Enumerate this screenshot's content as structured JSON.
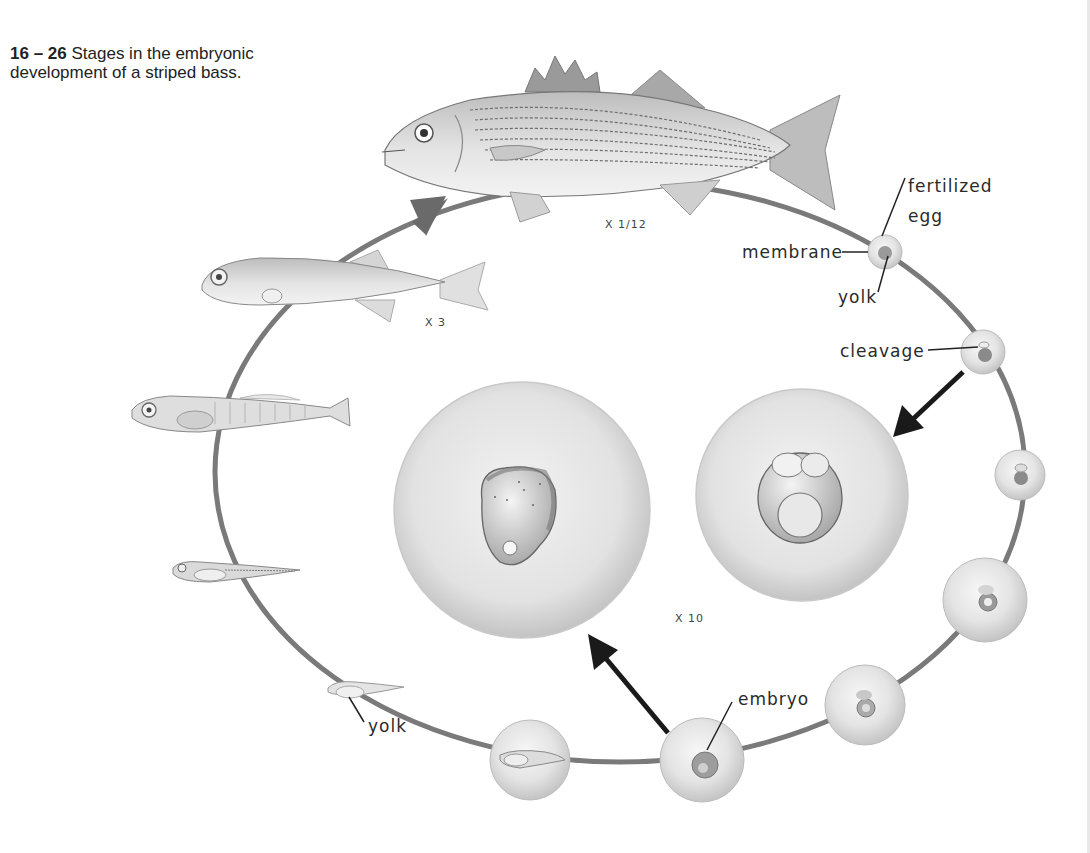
{
  "caption": {
    "figure_number": "16 – 26",
    "text": " Stages in the embryonic development of a striped bass."
  },
  "labels": {
    "fertilized_egg_line1": "fertilized",
    "fertilized_egg_line2": "egg",
    "membrane": "membrane",
    "yolk_egg": "yolk",
    "cleavage": "cleavage",
    "embryo": "embryo",
    "yolk_larva": "yolk"
  },
  "scales": {
    "adult": "X 1/12",
    "juvenile": "X 3",
    "eggs_enlarged": "X 10"
  },
  "colors": {
    "cycle_ring": "#7a7a7a",
    "arrow_dark": "#1a1a1a",
    "arrow_gray": "#6a6a6a",
    "egg_fill": "#e6e6e6",
    "fish_body": "#d9d9d9"
  },
  "stages": [
    {
      "name": "fertilized egg"
    },
    {
      "name": "cleavage"
    },
    {
      "name": "early blastula"
    },
    {
      "name": "gastrula"
    },
    {
      "name": "embryo forming"
    },
    {
      "name": "embryo"
    },
    {
      "name": "hatching larva"
    },
    {
      "name": "yolk-sac larva"
    },
    {
      "name": "larva"
    },
    {
      "name": "post-larva"
    },
    {
      "name": "juvenile"
    },
    {
      "name": "adult striped bass"
    }
  ]
}
